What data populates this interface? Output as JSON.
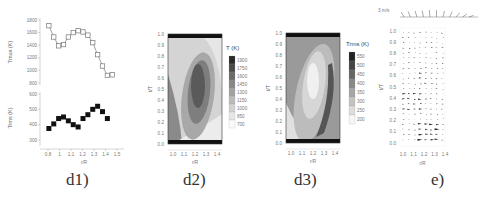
{
  "captions": {
    "d1": "d1)",
    "d2": "d2)",
    "d3": "d3)",
    "e": "e)"
  },
  "chart_data": [
    {
      "id": "d1-top",
      "type": "line",
      "marker": "open-square",
      "xlabel": "r/R",
      "ylabel": "T_max (K)",
      "x": [
        0.85,
        0.9,
        0.95,
        1.0,
        1.05,
        1.1,
        1.15,
        1.2,
        1.25,
        1.3,
        1.35,
        1.4,
        1.45,
        1.5
      ],
      "y": [
        1710,
        1530,
        1390,
        1410,
        1530,
        1600,
        1630,
        1610,
        1560,
        1440,
        1250,
        1070,
        920,
        930
      ],
      "yticks": [
        800,
        1000,
        1200,
        1400,
        1600,
        1800
      ],
      "ylim": [
        800,
        1800
      ]
    },
    {
      "id": "d1-bottom",
      "type": "line",
      "marker": "filled-square",
      "line": false,
      "xlabel": "r/R",
      "ylabel": "T_rms (K)",
      "x": [
        0.95,
        1.0,
        1.05,
        1.1,
        1.15,
        1.2,
        1.25,
        1.3,
        1.35,
        1.4,
        1.45,
        1.5,
        1.55
      ],
      "y": [
        375,
        405,
        440,
        450,
        425,
        400,
        385,
        440,
        465,
        500,
        520,
        485,
        440
      ],
      "xticks": [
        "0.8",
        "1",
        "1.1",
        "1.2",
        "1.3",
        "1.4",
        "1.5"
      ],
      "yticks": [
        300,
        400,
        500,
        600
      ],
      "ylim": [
        300,
        600
      ]
    },
    {
      "id": "d2",
      "type": "heatmap",
      "title": "T (K)",
      "xlabel": "r/R",
      "ylabel": "t/T",
      "xticks": [
        "1.0",
        "1.1",
        "1.2",
        "1.3",
        "1.4"
      ],
      "yticks": [
        "0.0",
        "0.1",
        "0.2",
        "0.3",
        "0.4",
        "0.5",
        "0.6",
        "0.7",
        "0.8",
        "0.9",
        "1.0"
      ],
      "colorbar": [
        "1900",
        "1750",
        "1600",
        "1450",
        "1300",
        "1150",
        "1000",
        "850",
        "700"
      ]
    },
    {
      "id": "d3",
      "type": "heatmap",
      "title": "Trms (K)",
      "xlabel": "r/R",
      "ylabel": "t/T",
      "xticks": [
        "1.0",
        "1.1",
        "1.2",
        "1.3",
        "1.4"
      ],
      "yticks": [
        "0.0",
        "0.1",
        "0.2",
        "0.3",
        "0.4",
        "0.5",
        "0.6",
        "0.7",
        "0.8",
        "0.9",
        "1.0"
      ],
      "colorbar": [
        "550",
        "500",
        "450",
        "400",
        "350",
        "300",
        "250",
        "200"
      ]
    },
    {
      "id": "e",
      "type": "scatter",
      "subtype": "vector-field",
      "xlabel": "r/R",
      "ylabel": "t/T",
      "xticks": [
        "1.0",
        "1.1",
        "1.2",
        "1.3",
        "1.4"
      ],
      "yticks": [
        "0.0",
        "0.1",
        "0.2",
        "0.3",
        "0.4",
        "0.5",
        "0.6",
        "0.7",
        "0.8",
        "0.9",
        "1.0"
      ],
      "reference_label": "3 m/s"
    }
  ],
  "ui": {
    "d1_ylabel_top": "T",
    "d1_ylabel_top_sub": "max",
    "d1_ylabel_top_unit": "(K)",
    "d1_ylabel_bot": "T",
    "d1_ylabel_bot_sub": "rms",
    "d1_ylabel_bot_unit": "(K)",
    "xlabel": "r/R",
    "ylabel": "t/T"
  }
}
